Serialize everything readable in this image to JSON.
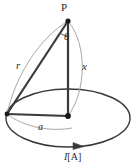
{
  "figure": {
    "background_color": "#ffffff",
    "width": 138,
    "height": 167,
    "labels": {
      "point_p": "P",
      "angle_theta": "θ",
      "slant_distance_r": "r",
      "axial_distance_x": "x",
      "loop_radius_a": "a",
      "current_symbol": "I",
      "current_unit": "[A]"
    },
    "colors": {
      "stroke_dark": "#2b2b2b",
      "stroke_thin": "#9a9a9a",
      "point_fill": "#1a1a1a",
      "text": "#2b2b2b"
    },
    "geometry": {
      "apex_point": [
        68,
        21
      ],
      "center_point": [
        68,
        116
      ],
      "loop_left_point": [
        7,
        114
      ],
      "ellipse_center": [
        68,
        118
      ],
      "ellipse_rx": 63,
      "ellipse_ry": 30,
      "current_arrow_direction": "counterclockwise"
    }
  }
}
